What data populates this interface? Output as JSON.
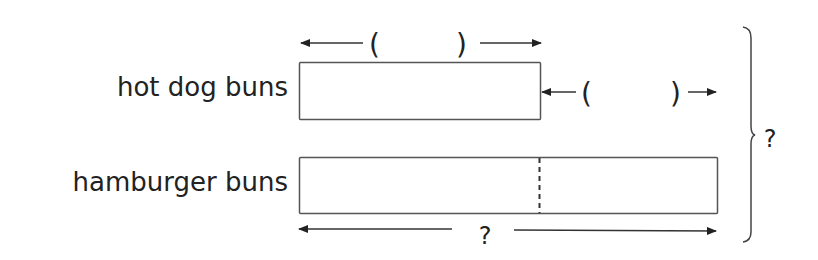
{
  "diagram": {
    "type": "tape-diagram",
    "rows": [
      {
        "label": "hot dog buns",
        "bar": {
          "x": 299,
          "y": 62,
          "width": 241,
          "height": 57
        }
      },
      {
        "label": "hamburger buns",
        "bar": {
          "x": 299,
          "y": 157,
          "width": 418,
          "height": 56
        },
        "divider_x": 539,
        "divider_style": "dashed"
      }
    ],
    "annotations": {
      "top_bracket": {
        "open": "(",
        "close": ")",
        "value": ""
      },
      "difference_bracket": {
        "open": "(",
        "close": ")",
        "value": ""
      },
      "bottom_total": "?",
      "grand_total": "?"
    },
    "colors": {
      "stroke": "#555555",
      "text": "#222222",
      "background": "#ffffff"
    }
  }
}
